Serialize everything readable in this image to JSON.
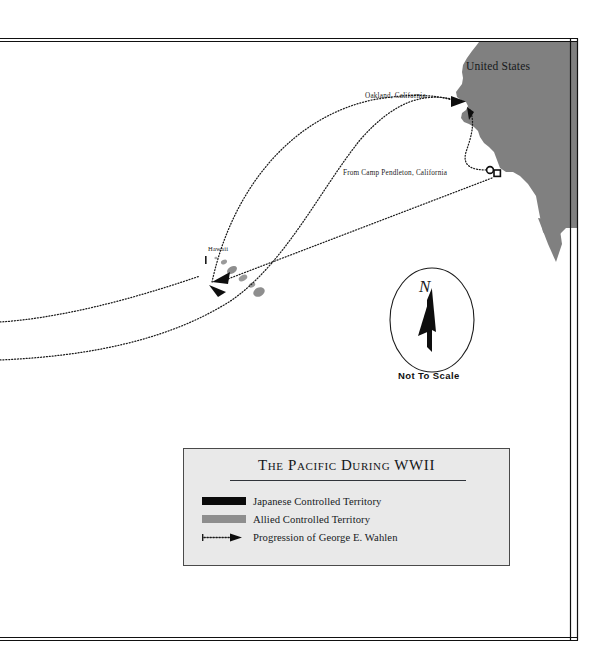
{
  "map": {
    "title": "The Pacific During WWII",
    "labels": {
      "united_states": "United States",
      "oakland": "Oakland, California",
      "camp_pendleton": "From Camp Pendleton, California",
      "hawaii": "Hawaii"
    },
    "compass": {
      "north_letter": "N",
      "scale_note": "Not To Scale"
    },
    "legend": {
      "title": "The Pacific During WWII",
      "items": [
        {
          "label": "Japanese Controlled Territory",
          "symbol": "black-swatch",
          "color": "#0b0b0b"
        },
        {
          "label": "Allied Controlled Territory",
          "symbol": "gray-swatch",
          "color": "#8e8e8e"
        },
        {
          "label": "Progression of George E. Wahlen",
          "symbol": "dotted-arrow",
          "color": "#1b1b1b"
        }
      ]
    },
    "colors": {
      "ocean": "#ffffff",
      "land": "#808080",
      "legend_background": "#e9e9e9",
      "frame": "#111111",
      "route": "#1b1b1b"
    }
  }
}
